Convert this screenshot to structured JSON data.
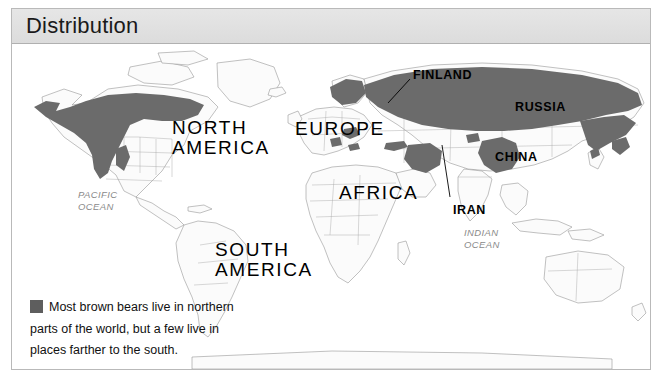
{
  "header": {
    "title": "Distribution"
  },
  "legend": {
    "swatch_color": "#5e5e5e",
    "text": "Most brown bears live in northern parts of the world, but a few live in places farther to the south."
  },
  "map": {
    "land_fill": "#fbfbfb",
    "border_color": "#8d8d8d",
    "range_fill": "#6b6b6b",
    "continents": [
      {
        "name": "north-america",
        "label": "NORTH\nAMERICA",
        "x": 160,
        "y": 73
      },
      {
        "name": "south-america",
        "label": "SOUTH\nAMERICA",
        "x": 203,
        "y": 195
      },
      {
        "name": "europe",
        "label": "EUROPE",
        "x": 283,
        "y": 74
      },
      {
        "name": "africa",
        "label": "AFRICA",
        "x": 327,
        "y": 138
      }
    ],
    "countries": [
      {
        "name": "finland",
        "label": "FINLAND",
        "x": 401,
        "y": 24
      },
      {
        "name": "russia",
        "label": "RUSSIA",
        "x": 503,
        "y": 56
      },
      {
        "name": "china",
        "label": "CHINA",
        "x": 483,
        "y": 106
      },
      {
        "name": "iran",
        "label": "IRAN",
        "x": 441,
        "y": 159
      }
    ],
    "oceans": [
      {
        "name": "pacific-ocean",
        "label": "PACIFIC\nOCEAN",
        "x": 66,
        "y": 144
      },
      {
        "name": "indian-ocean",
        "label": "INDIAN\nOCEAN",
        "x": 452,
        "y": 182
      }
    ]
  }
}
